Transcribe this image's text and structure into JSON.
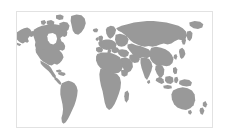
{
  "figure": {
    "title": "World Map",
    "type": "world-map",
    "background_color": "#ffffff"
  },
  "frame": {
    "border_color": "#e2e2e2",
    "border_width_px": 1,
    "fill_color": "#ffffff",
    "left_px": 16,
    "top_px": 11,
    "width_px": 197,
    "height_px": 117
  },
  "map": {
    "projection": "equirectangular",
    "land_color": "#999999",
    "ocean_color": "#ffffff",
    "graticule_visible": false,
    "labels_visible": false,
    "antarctica_included": false,
    "lon_range": [
      -169,
      191
    ],
    "lat_range": [
      -58,
      84
    ],
    "regions": [
      "North America",
      "Greenland",
      "South America",
      "Europe",
      "Africa",
      "Asia",
      "Australia",
      "Indonesia",
      "New Zealand",
      "Japan",
      "British Isles",
      "Madagascar"
    ]
  },
  "chart_data": {
    "type": "map",
    "title": "World Map",
    "xlabel": "",
    "ylabel": "",
    "series": [
      {
        "name": "Landmass",
        "color": "#999999",
        "values": []
      }
    ],
    "legend": [],
    "annotations": []
  }
}
